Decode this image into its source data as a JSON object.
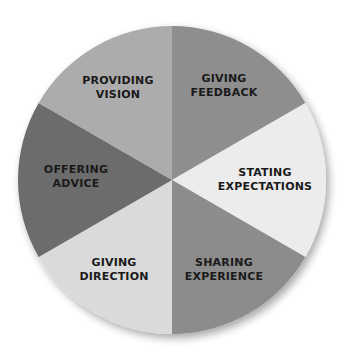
{
  "diagram": {
    "type": "segmented-circle",
    "center": [
      172,
      180
    ],
    "radius": 154,
    "segments": [
      {
        "id": "giving-feedback",
        "line1": "GIVING",
        "line2": "FEEDBACK",
        "start_deg": 0,
        "end_deg": 60,
        "color": "#8e8e8e",
        "label_pos": [
          224,
          86
        ]
      },
      {
        "id": "stating-expectations",
        "line1": "STATING",
        "line2": "EXPECTATIONS",
        "start_deg": 60,
        "end_deg": 120,
        "color": "#ececec",
        "label_pos": [
          265,
          180
        ]
      },
      {
        "id": "sharing-experience",
        "line1": "SHARING",
        "line2": "EXPERIENCE",
        "start_deg": 120,
        "end_deg": 180,
        "color": "#8c8c8c",
        "label_pos": [
          224,
          270
        ]
      },
      {
        "id": "giving-direction",
        "line1": "GIVING",
        "line2": "DIRECTION",
        "start_deg": 180,
        "end_deg": 240,
        "color": "#dadada",
        "label_pos": [
          114,
          270
        ]
      },
      {
        "id": "offering-advice",
        "line1": "OFFERING",
        "line2": "ADVICE",
        "start_deg": 240,
        "end_deg": 300,
        "color": "#6c6c6c",
        "label_pos": [
          76,
          177
        ]
      },
      {
        "id": "providing-vision",
        "line1": "PROVIDING",
        "line2": "VISION",
        "start_deg": 300,
        "end_deg": 360,
        "color": "#acacac",
        "label_pos": [
          118,
          88
        ]
      }
    ]
  }
}
